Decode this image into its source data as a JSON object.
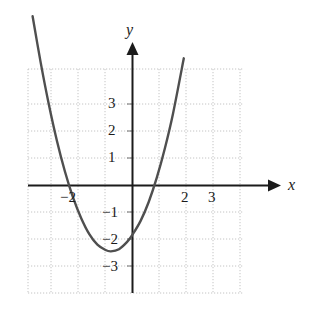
{
  "chart_data": {
    "type": "line",
    "title": "",
    "xlabel": "x",
    "ylabel": "y",
    "grid": true,
    "legend": null,
    "xlim": [
      -3.85,
      4.1
    ],
    "ylim": [
      -4.3,
      4.3
    ],
    "xticks": [
      -2,
      2,
      3
    ],
    "yticks": [
      3,
      2,
      1,
      -1,
      -2,
      -3
    ],
    "xtick_labels": [
      "−2",
      "2",
      "3"
    ],
    "ytick_labels": [
      "3",
      "2",
      "1",
      "−1",
      "−2",
      "−3"
    ],
    "gridline_step": 1,
    "curve": {
      "name": "parabola",
      "equation_form": "y = a(x - h)^2 + k",
      "vertex": [
        -0.8,
        -4.0
      ],
      "y_intercept": -3.2,
      "x_intercepts": [
        -2.75,
        1.15
      ],
      "opens": "up",
      "leading_coefficient": 1.25,
      "x_range": [
        -3.7,
        1.9
      ],
      "points": [
        [
          -3.7,
          6.27
        ],
        [
          -3.4,
          4.55
        ],
        [
          -3.1,
          3.01
        ],
        [
          -2.8,
          1.66
        ],
        [
          -2.5,
          0.51
        ],
        [
          -2.2,
          -0.45
        ],
        [
          -1.9,
          -1.21
        ],
        [
          -1.6,
          -1.8
        ],
        [
          -1.3,
          -2.19
        ],
        [
          -1.0,
          -2.39
        ],
        [
          -0.8,
          -2.44
        ],
        [
          -0.5,
          -2.36
        ],
        [
          -0.2,
          -2.09
        ],
        [
          0.0,
          -1.82
        ],
        [
          0.3,
          -1.31
        ],
        [
          0.6,
          -0.61
        ],
        [
          0.9,
          0.29
        ],
        [
          1.2,
          1.38
        ],
        [
          1.5,
          2.66
        ],
        [
          1.9,
          4.71
        ]
      ]
    }
  },
  "axes": {
    "x_axis_label": "x",
    "y_axis_label": "y"
  },
  "colors": {
    "background": "#ffffff",
    "grid": "#bfbfbf",
    "axis": "#1b1b1b",
    "curve": "#4a4a4a",
    "text": "#1b1b1b"
  },
  "ytick_items": [
    {
      "label": "3",
      "top": 96,
      "left": 108
    },
    {
      "label": "2",
      "top": 123,
      "left": 108
    },
    {
      "label": "1",
      "top": 150,
      "left": 108
    },
    {
      "label": "−1",
      "top": 205,
      "left": 102
    },
    {
      "label": "−2",
      "top": 232,
      "left": 102
    },
    {
      "label": "−3",
      "top": 259,
      "left": 102
    }
  ],
  "xtick_items": [
    {
      "label": "−2",
      "top": 190,
      "left": 60
    },
    {
      "label": "2",
      "top": 190,
      "left": 181
    },
    {
      "label": "3",
      "top": 190,
      "left": 208
    }
  ]
}
